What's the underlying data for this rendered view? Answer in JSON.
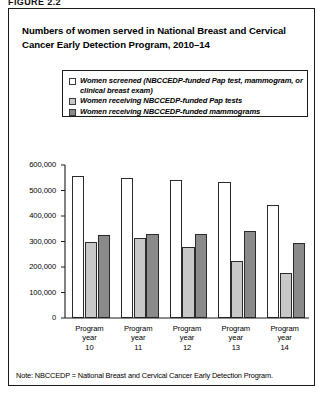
{
  "figure_label": "FIGURE 2.2",
  "chart_title": "Numbers of women served in National Breast and Cervical Cancer Early Detection Program, 2010–14",
  "note": "Note: NBCCEDP = National Breast and Cervical Cancer Early Detection Program.",
  "legend": {
    "items": [
      {
        "label": "Women screened (NBCCEDP-funded Pap test, mammogram, or clinical breast exam)",
        "color": "#ffffff"
      },
      {
        "label": "Women receiving NBCCEDP-funded Pap tests",
        "color": "#c8c8c8"
      },
      {
        "label": "Women receiving NBCCEDP-funded mammograms",
        "color": "#8a8a8a"
      }
    ]
  },
  "chart_data": {
    "type": "bar",
    "title": "Numbers of women served in National Breast and Cervical Cancer Early Detection Program, 2010–14",
    "xlabel": "",
    "ylabel": "",
    "categories": [
      "Program year 10",
      "Program year 11",
      "Program year 12",
      "Program year 13",
      "Program year 14"
    ],
    "category_lines": [
      [
        "Program",
        "year",
        "10"
      ],
      [
        "Program",
        "year",
        "11"
      ],
      [
        "Program",
        "year",
        "12"
      ],
      [
        "Program",
        "year",
        "13"
      ],
      [
        "Program",
        "year",
        "14"
      ]
    ],
    "series": [
      {
        "name": "Women screened (NBCCEDP-funded Pap test, mammogram, or clinical breast exam)",
        "color": "#ffffff",
        "values": [
          555000,
          548000,
          540000,
          533000,
          445000
        ]
      },
      {
        "name": "Women receiving NBCCEDP-funded Pap tests",
        "color": "#c8c8c8",
        "values": [
          300000,
          315000,
          280000,
          222000,
          178000
        ]
      },
      {
        "name": "Women receiving NBCCEDP-funded mammograms",
        "color": "#8a8a8a",
        "values": [
          325000,
          330000,
          330000,
          342000,
          293000
        ]
      }
    ],
    "ylim": [
      0,
      600000
    ],
    "yticks": [
      0,
      100000,
      200000,
      300000,
      400000,
      500000,
      600000
    ],
    "ytick_labels": [
      "0",
      "100,000",
      "200,000",
      "300,000",
      "400,000",
      "500,000",
      "600,000"
    ],
    "grid": false,
    "legend_position": "top-inside"
  }
}
